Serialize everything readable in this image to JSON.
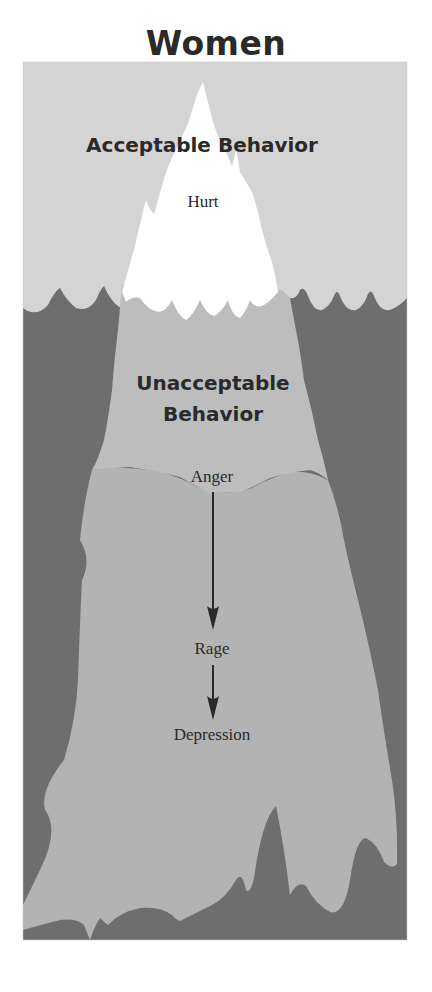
{
  "title": "Women",
  "diagram": {
    "type": "iceberg",
    "above_water": {
      "heading": "Acceptable Behavior",
      "emotions": [
        "Hurt"
      ]
    },
    "below_water": {
      "heading_line1": "Unacceptable",
      "heading_line2": "Behavior",
      "emotions": [
        "Anger",
        "Rage",
        "Depression"
      ],
      "flow": [
        {
          "from": "Anger",
          "to": "Rage"
        },
        {
          "from": "Rage",
          "to": "Depression"
        }
      ]
    },
    "colors": {
      "sky": "#d4d4d4",
      "water": "#6e6e6e",
      "tip": "#ffffff",
      "berg_upper": "#bdbdbd",
      "berg_lower": "#b3b3b3",
      "text": "#2a2a2a"
    }
  }
}
